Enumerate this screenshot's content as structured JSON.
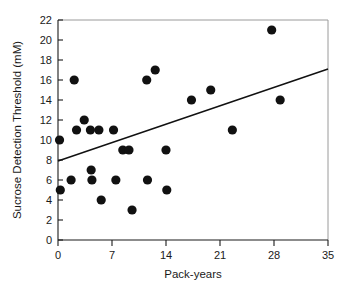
{
  "chart_data": {
    "type": "scatter",
    "title": "",
    "xlabel": "Pack-years",
    "ylabel": "Sucrose Detection Threshold (mM)",
    "xlim": [
      0,
      35
    ],
    "ylim": [
      0,
      22
    ],
    "xticks": [
      0,
      7,
      14,
      21,
      28,
      35
    ],
    "yticks": [
      0,
      2,
      4,
      6,
      8,
      10,
      12,
      14,
      16,
      18,
      20,
      22
    ],
    "xtick_labels": [
      "0",
      "7",
      "14",
      "21",
      "28",
      "35"
    ],
    "ytick_labels": [
      "0",
      "2",
      "4",
      "6",
      "8",
      "10",
      "12",
      "14",
      "16",
      "18",
      "20",
      "22"
    ],
    "grid": false,
    "legend": "none",
    "marker": "filled-circle",
    "marker_color": "#111111",
    "points": [
      {
        "x": 0.2,
        "y": 10
      },
      {
        "x": 0.3,
        "y": 5
      },
      {
        "x": 1.7,
        "y": 6
      },
      {
        "x": 2.1,
        "y": 16
      },
      {
        "x": 2.4,
        "y": 11
      },
      {
        "x": 3.4,
        "y": 12
      },
      {
        "x": 4.2,
        "y": 11
      },
      {
        "x": 4.3,
        "y": 7
      },
      {
        "x": 4.4,
        "y": 6
      },
      {
        "x": 5.3,
        "y": 11
      },
      {
        "x": 5.6,
        "y": 4
      },
      {
        "x": 7.2,
        "y": 11
      },
      {
        "x": 7.5,
        "y": 6
      },
      {
        "x": 8.4,
        "y": 9
      },
      {
        "x": 9.2,
        "y": 9
      },
      {
        "x": 9.6,
        "y": 3
      },
      {
        "x": 11.5,
        "y": 16
      },
      {
        "x": 11.6,
        "y": 6
      },
      {
        "x": 12.6,
        "y": 17
      },
      {
        "x": 14.0,
        "y": 9
      },
      {
        "x": 14.1,
        "y": 5
      },
      {
        "x": 17.3,
        "y": 14
      },
      {
        "x": 19.8,
        "y": 15
      },
      {
        "x": 22.6,
        "y": 11
      },
      {
        "x": 27.7,
        "y": 21
      },
      {
        "x": 28.8,
        "y": 14
      }
    ],
    "trend_line": {
      "type": "linear-fit",
      "x_start": 0,
      "y_start": 7.9,
      "x_end": 35,
      "y_end": 17.1,
      "color": "#111111"
    }
  },
  "axes": {
    "x_axis_name": "Pack-years",
    "y_axis_name": "Sucrose Detection Threshold (mM)"
  }
}
